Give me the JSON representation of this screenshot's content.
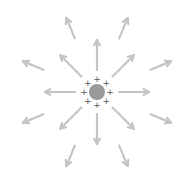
{
  "diagram": {
    "caption_partial": "",
    "center": {
      "x": 97,
      "y": 92
    },
    "charge": {
      "radius": 8,
      "color": "#9a9a9a",
      "sign": "+",
      "plus_count": 8,
      "plus_radius": 13,
      "plus_color": "#555555"
    },
    "arrow_color": "#c4c4c4",
    "inner_arrows": {
      "count": 8,
      "r_start": 22,
      "r_end": 52
    },
    "outer_arrows": {
      "count": 8,
      "offset_deg": 22.5,
      "r_start": 58,
      "r_end": 80
    }
  }
}
